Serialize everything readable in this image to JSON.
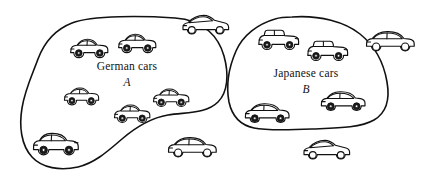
{
  "figure": {
    "type": "set-diagram",
    "width": 424,
    "height": 181,
    "background_color": "#ffffff",
    "stroke_color": "#111111"
  },
  "sets": [
    {
      "id": "A",
      "label": "German cars",
      "letter": "A",
      "label_x": 127,
      "label_y": 70,
      "letter_x": 127,
      "letter_y": 86,
      "member_count": 6
    },
    {
      "id": "B",
      "label": "Japanese cars",
      "letter": "B",
      "label_x": 306,
      "label_y": 77,
      "letter_x": 306,
      "letter_y": 93,
      "member_count": 5
    }
  ],
  "cars": [
    {
      "id": "a1",
      "set": "A",
      "style": "hatchback",
      "x": 88,
      "y": 47,
      "scale": 1.0,
      "wheels": "solid"
    },
    {
      "id": "a2",
      "set": "A",
      "style": "hatchback",
      "x": 136,
      "y": 42,
      "scale": 1.0,
      "wheels": "solid"
    },
    {
      "id": "a3",
      "set": "A",
      "style": "hatchback",
      "x": 80,
      "y": 96,
      "scale": 0.92,
      "wheels": "solid"
    },
    {
      "id": "a4",
      "set": "A",
      "style": "hatchback",
      "x": 170,
      "y": 97,
      "scale": 0.95,
      "wheels": "solid"
    },
    {
      "id": "a5",
      "set": "A",
      "style": "hatchback",
      "x": 131,
      "y": 113,
      "scale": 0.95,
      "wheels": "solid"
    },
    {
      "id": "a6",
      "set": "A",
      "style": "sedan-boxy",
      "x": 55,
      "y": 143,
      "scale": 1.12,
      "wheels": "solid"
    },
    {
      "id": "b1",
      "set": "B",
      "style": "wagon",
      "x": 277,
      "y": 39,
      "scale": 1.0,
      "wheels": "solid"
    },
    {
      "id": "b2",
      "set": "B",
      "style": "wagon",
      "x": 326,
      "y": 50,
      "scale": 1.0,
      "wheels": "solid"
    },
    {
      "id": "b3",
      "set": "B",
      "style": "sedan-low",
      "x": 265,
      "y": 112,
      "scale": 1.0,
      "wheels": "solid"
    },
    {
      "id": "b4",
      "set": "B",
      "style": "sedan-low",
      "x": 341,
      "y": 100,
      "scale": 1.0,
      "wheels": "solid"
    },
    {
      "id": "o1",
      "set": "none",
      "style": "coupe",
      "x": 205,
      "y": 24,
      "scale": 1.05,
      "wheels": "open"
    },
    {
      "id": "o2",
      "set": "none",
      "style": "sedan-open",
      "x": 389,
      "y": 42,
      "scale": 1.15,
      "wheels": "open"
    },
    {
      "id": "o3",
      "set": "none",
      "style": "sedan-open",
      "x": 192,
      "y": 147,
      "scale": 1.12,
      "wheels": "open"
    },
    {
      "id": "o4",
      "set": "none",
      "style": "coupe",
      "x": 327,
      "y": 150,
      "scale": 1.05,
      "wheels": "open"
    }
  ],
  "outlines": {
    "setA": "M 175 18 C 205 20 219 38 224 56 C 229 74 228 92 218 102 C 206 114 186 112 168 115 C 150 118 136 127 122 139 C 108 151 95 163 78 167 C 60 171 42 168 32 157 C 21 145 19 126 22 108 C 25 89 33 73 38 59 C 44 43 54 30 72 23 C 92 15 145 16 175 18 Z",
    "setB": "M 292 17 C 320 15 345 22 360 34 C 375 46 384 64 387 82 C 390 99 386 113 374 120 C 360 128 336 128 312 129 C 290 130 268 131 254 128 C 240 125 232 116 229 102 C 226 86 229 67 236 51 C 243 35 258 24 275 19 C 281 17 286 17 292 17 Z"
  }
}
